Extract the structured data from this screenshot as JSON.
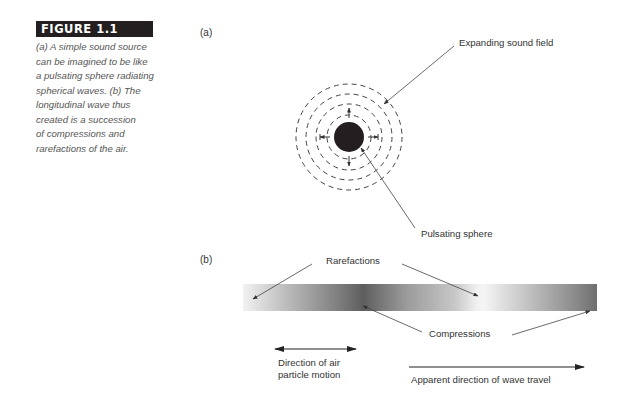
{
  "figure": {
    "label": "FIGURE 1.1",
    "caption_lines": [
      "(a) A simple sound source",
      "can be imagined to be like",
      "a pulsating sphere radiating",
      "spherical waves. (b) The",
      "longitudinal wave thus",
      "created is a succession",
      "of compressions and",
      "rarefactions of the air."
    ]
  },
  "panel_a": {
    "label": "(a)",
    "annotations": {
      "expanding_field": "Expanding sound field",
      "pulsating_sphere": "Pulsating sphere"
    },
    "sphere": {
      "cx": 349,
      "cy": 137,
      "r": 15,
      "color": "#231f20"
    },
    "rings_radii": [
      22,
      33,
      43,
      53
    ]
  },
  "panel_b": {
    "label": "(b)",
    "annotations": {
      "rarefactions": "Rarefactions",
      "compressions": "Compressions",
      "particle_motion_lines": [
        "Direction of air",
        "particle motion"
      ],
      "wave_travel": "Apparent direction of wave travel"
    },
    "bar": {
      "x": 243,
      "y": 284,
      "width": 354,
      "height": 27
    }
  }
}
